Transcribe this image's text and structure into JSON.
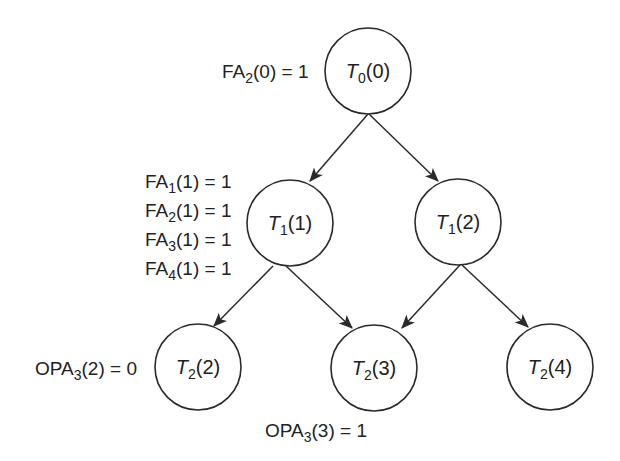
{
  "diagram": {
    "type": "task-tree",
    "colors": {
      "stroke": "#2a2a2a",
      "text": "#222222",
      "background": "#ffffff"
    },
    "nodes": [
      {
        "id": "n00",
        "base": "T",
        "sub": "0",
        "arg": "(0)",
        "cx": 368,
        "cy": 71,
        "r": 43
      },
      {
        "id": "n11",
        "base": "T",
        "sub": "1",
        "arg": "(1)",
        "cx": 290,
        "cy": 223,
        "r": 43
      },
      {
        "id": "n12",
        "base": "T",
        "sub": "1",
        "arg": "(2)",
        "cx": 458,
        "cy": 222,
        "r": 43
      },
      {
        "id": "n22",
        "base": "T",
        "sub": "2",
        "arg": "(2)",
        "cx": 198,
        "cy": 367,
        "r": 43
      },
      {
        "id": "n23",
        "base": "T",
        "sub": "2",
        "arg": "(3)",
        "cx": 374,
        "cy": 368,
        "r": 43
      },
      {
        "id": "n24",
        "base": "T",
        "sub": "2",
        "arg": "(4)",
        "cx": 550,
        "cy": 367,
        "r": 43
      }
    ],
    "edges": [
      {
        "from": "n00",
        "to": "n11",
        "x1": 368,
        "y1": 114,
        "x2": 310,
        "y2": 181
      },
      {
        "from": "n00",
        "to": "n12",
        "x1": 369,
        "y1": 114,
        "x2": 438,
        "y2": 181
      },
      {
        "from": "n11",
        "to": "n22",
        "x1": 273,
        "y1": 266,
        "x2": 214,
        "y2": 326
      },
      {
        "from": "n11",
        "to": "n23",
        "x1": 286,
        "y1": 266,
        "x2": 352,
        "y2": 328
      },
      {
        "from": "n12",
        "to": "n23",
        "x1": 460,
        "y1": 265,
        "x2": 402,
        "y2": 328
      },
      {
        "from": "n12",
        "to": "n24",
        "x1": 462,
        "y1": 265,
        "x2": 528,
        "y2": 327
      }
    ],
    "labels": [
      {
        "id": "fa2-0",
        "pre": "FA",
        "sub": "2",
        "post": "(0) = 1",
        "x": 222,
        "y": 78
      },
      {
        "id": "fa1-1",
        "pre": "FA",
        "sub": "1",
        "post": "(1) = 1",
        "x": 145,
        "y": 188
      },
      {
        "id": "fa2-1",
        "pre": "FA",
        "sub": "2",
        "post": "(1) = 1",
        "x": 145,
        "y": 217
      },
      {
        "id": "fa3-1",
        "pre": "FA",
        "sub": "3",
        "post": "(1) = 1",
        "x": 145,
        "y": 246
      },
      {
        "id": "fa4-1",
        "pre": "FA",
        "sub": "4",
        "post": "(1) = 1",
        "x": 145,
        "y": 275
      },
      {
        "id": "opa3-2",
        "pre": "OPA",
        "sub": "3",
        "post": "(2) = 0",
        "x": 35,
        "y": 375
      },
      {
        "id": "opa3-3",
        "pre": "OPA",
        "sub": "3",
        "post": "(3) = 1",
        "x": 265,
        "y": 437
      }
    ]
  }
}
